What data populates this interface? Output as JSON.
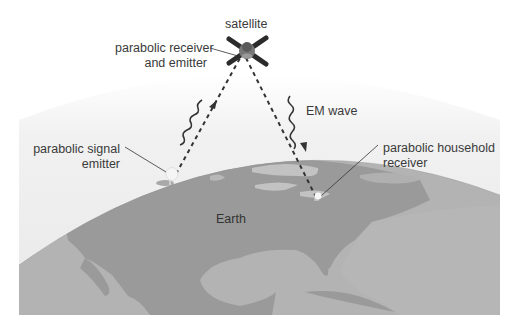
{
  "diagram": {
    "labels": {
      "satellite": "satellite",
      "satellite_dish_line1": "parabolic receiver",
      "satellite_dish_line2": "and emitter",
      "em_wave": "EM wave",
      "emitter_line1": "parabolic signal",
      "emitter_line2": "emitter",
      "receiver_line1": "parabolic household",
      "receiver_line2": "receiver",
      "earth": "Earth"
    },
    "elements": [
      {
        "id": "satellite",
        "type": "icon",
        "icon": "satellite-icon",
        "position": [
          243,
          48
        ]
      },
      {
        "id": "emitter-dish",
        "type": "icon",
        "icon": "parabolic-dish-icon",
        "position": [
          170,
          178
        ]
      },
      {
        "id": "household-dish",
        "type": "icon",
        "icon": "parabolic-dish-icon",
        "position": [
          317,
          199
        ]
      },
      {
        "id": "uplink-path",
        "type": "dashed-line",
        "from": "emitter-dish",
        "to": "satellite"
      },
      {
        "id": "downlink-path",
        "type": "dashed-line",
        "from": "satellite",
        "to": "household-dish"
      },
      {
        "id": "uplink-wave",
        "type": "wavy-arrow",
        "direction": "up"
      },
      {
        "id": "downlink-wave",
        "type": "wavy-arrow",
        "direction": "down"
      }
    ],
    "colors": {
      "background": "#ffffff",
      "atmosphere": "#ececec",
      "ocean": "#b5b5b5",
      "land": "#9b9b9b",
      "land_light": "#c2c2c2",
      "text": "#3a3a3a",
      "line": "#333333"
    }
  }
}
